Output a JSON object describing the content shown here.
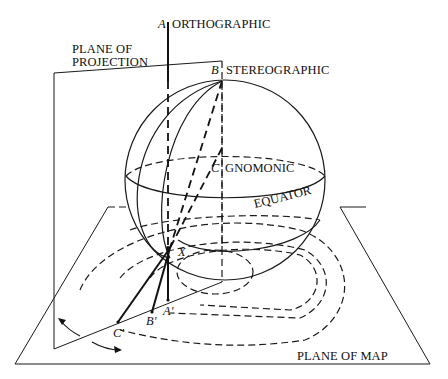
{
  "diagram": {
    "labels": {
      "plane_of_projection_line1": "PLANE OF",
      "plane_of_projection_line2": "PROJECTION",
      "orthographic": "ORTHOGRAPHIC",
      "stereographic": "STEREOGRAPHIC",
      "gnomonic": "GNOMONIC",
      "equator": "EQUATOR",
      "plane_of_map": "PLANE OF MAP"
    },
    "points": {
      "A": "A",
      "B": "B",
      "C": "C",
      "X": "X",
      "A_prime": "A'",
      "B_prime": "B'",
      "C_prime": "C'"
    },
    "colors": {
      "stroke": "#1a1a1a",
      "background": "#ffffff"
    }
  }
}
